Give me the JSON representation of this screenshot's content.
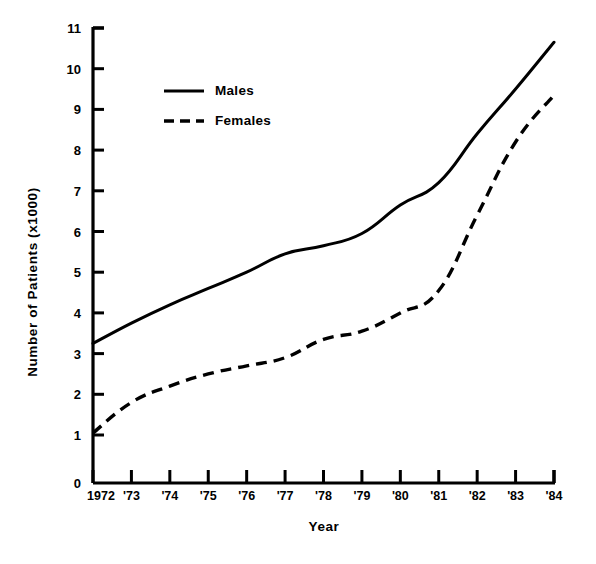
{
  "chart_data": {
    "type": "line",
    "title": "",
    "xlabel": "Year",
    "ylabel": "Number of Patients (x1000)",
    "categories": [
      "1972",
      "'73",
      "'74",
      "'75",
      "'76",
      "'77",
      "'78",
      "'79",
      "'80",
      "'81",
      "'82",
      "'83",
      "'84"
    ],
    "x": [
      1972,
      1973,
      1974,
      1975,
      1976,
      1977,
      1978,
      1979,
      1980,
      1981,
      1982,
      1983,
      1984
    ],
    "series": [
      {
        "name": "Males",
        "style": "solid",
        "color": "#000000",
        "values": [
          3.25,
          3.75,
          4.2,
          4.6,
          5.0,
          5.45,
          5.65,
          5.95,
          6.65,
          7.2,
          8.4,
          9.5,
          10.65
        ]
      },
      {
        "name": "Females",
        "style": "dashed",
        "color": "#000000",
        "values": [
          1.05,
          1.8,
          2.2,
          2.5,
          2.7,
          2.9,
          3.35,
          3.55,
          4.0,
          4.55,
          6.4,
          8.2,
          9.35
        ]
      }
    ],
    "ylim": [
      1,
      11
    ],
    "yticks": [
      1,
      2,
      3,
      4,
      5,
      6,
      7,
      8,
      9,
      10,
      11
    ],
    "ytick_labels": [
      "1",
      "2",
      "3",
      "4",
      "5",
      "6",
      "7",
      "8",
      "9",
      "10",
      "11"
    ],
    "y_origin_label": "0",
    "axis_broken": true,
    "grid": false,
    "legend_position": "upper-left-inside",
    "legend": [
      "Males",
      "Females"
    ]
  },
  "axes": {
    "line_color": "#000000",
    "background": "#ffffff"
  }
}
